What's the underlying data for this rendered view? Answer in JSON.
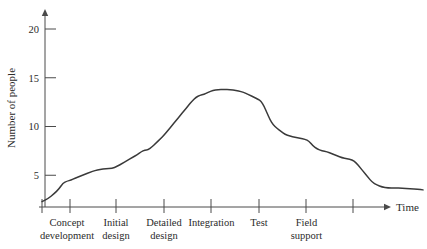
{
  "chart_data": {
    "type": "line",
    "title": "",
    "xlabel": "Time",
    "ylabel": "Number of people",
    "ylim": [
      0,
      21.5
    ],
    "xlim": [
      0,
      1
    ],
    "grid": false,
    "legend": null,
    "y_ticks": [
      5,
      10,
      15,
      20
    ],
    "y_tick_labels": [
      "5",
      "10",
      "15",
      "20"
    ],
    "x_axis_kind": "phase-bands",
    "phases": [
      {
        "label": "Concept development",
        "lines": [
          "Concept",
          "development"
        ],
        "start": 42,
        "end": 92
      },
      {
        "label": "Initial design",
        "lines": [
          "Initial",
          "design"
        ],
        "start": 92,
        "end": 140
      },
      {
        "label": "Detailed design",
        "lines": [
          "Detailed",
          "design"
        ],
        "start": 140,
        "end": 188
      },
      {
        "label": "Integration",
        "lines": [
          "Integration"
        ],
        "start": 188,
        "end": 235
      },
      {
        "label": "Test",
        "lines": [
          "Test"
        ],
        "start": 235,
        "end": 283
      },
      {
        "label": "Field support",
        "lines": [
          "Field",
          "support"
        ],
        "start": 283,
        "end": 330
      }
    ],
    "x_tick_positions": [
      42,
      70,
      116,
      164,
      211,
      259,
      306,
      353
    ],
    "series": [
      {
        "name": "Staffing level",
        "points": [
          [
            42,
            2.3
          ],
          [
            48,
            2.6
          ],
          [
            54,
            3.1
          ],
          [
            59,
            3.6
          ],
          [
            63,
            4.2
          ],
          [
            67,
            4.4
          ],
          [
            71,
            4.5
          ],
          [
            75,
            4.7
          ],
          [
            80,
            4.9
          ],
          [
            85,
            5.1
          ],
          [
            90,
            5.3
          ],
          [
            95,
            5.5
          ],
          [
            100,
            5.6
          ],
          [
            106,
            5.7
          ],
          [
            112,
            5.7
          ],
          [
            117,
            5.9
          ],
          [
            122,
            6.2
          ],
          [
            127,
            6.5
          ],
          [
            132,
            6.8
          ],
          [
            137,
            7.1
          ],
          [
            141,
            7.4
          ],
          [
            145,
            7.6
          ],
          [
            148,
            7.6
          ],
          [
            152,
            7.9
          ],
          [
            156,
            8.3
          ],
          [
            160,
            8.7
          ],
          [
            164,
            9.1
          ],
          [
            168,
            9.6
          ],
          [
            172,
            10.1
          ],
          [
            176,
            10.6
          ],
          [
            180,
            11.1
          ],
          [
            184,
            11.6
          ],
          [
            188,
            12.1
          ],
          [
            192,
            12.6
          ],
          [
            196,
            13.0
          ],
          [
            200,
            13.2
          ],
          [
            204,
            13.3
          ],
          [
            208,
            13.5
          ],
          [
            213,
            13.7
          ],
          [
            218,
            13.8
          ],
          [
            224,
            13.8
          ],
          [
            230,
            13.8
          ],
          [
            236,
            13.7
          ],
          [
            241,
            13.6
          ],
          [
            246,
            13.4
          ],
          [
            250,
            13.2
          ],
          [
            254,
            13.0
          ],
          [
            258,
            12.8
          ],
          [
            261,
            12.6
          ],
          [
            264,
            12.1
          ],
          [
            267,
            11.4
          ],
          [
            270,
            10.7
          ],
          [
            273,
            10.2
          ],
          [
            277,
            9.8
          ],
          [
            281,
            9.5
          ],
          [
            285,
            9.2
          ],
          [
            290,
            9.0
          ],
          [
            295,
            8.9
          ],
          [
            300,
            8.8
          ],
          [
            305,
            8.7
          ],
          [
            309,
            8.5
          ],
          [
            313,
            8.0
          ],
          [
            317,
            7.7
          ],
          [
            322,
            7.5
          ],
          [
            327,
            7.4
          ],
          [
            332,
            7.2
          ],
          [
            337,
            7.0
          ],
          [
            342,
            6.8
          ],
          [
            347,
            6.7
          ],
          [
            352,
            6.6
          ],
          [
            356,
            6.3
          ],
          [
            360,
            5.8
          ],
          [
            364,
            5.3
          ],
          [
            368,
            4.8
          ],
          [
            372,
            4.3
          ],
          [
            377,
            4.0
          ],
          [
            382,
            3.8
          ],
          [
            388,
            3.7
          ],
          [
            395,
            3.7
          ],
          [
            402,
            3.7
          ],
          [
            410,
            3.6
          ],
          [
            418,
            3.6
          ],
          [
            423,
            3.5
          ]
        ]
      }
    ]
  },
  "axis": {
    "y_arrow": true,
    "x_arrow": true,
    "time_label": "Time",
    "people_label": "Number of people"
  }
}
